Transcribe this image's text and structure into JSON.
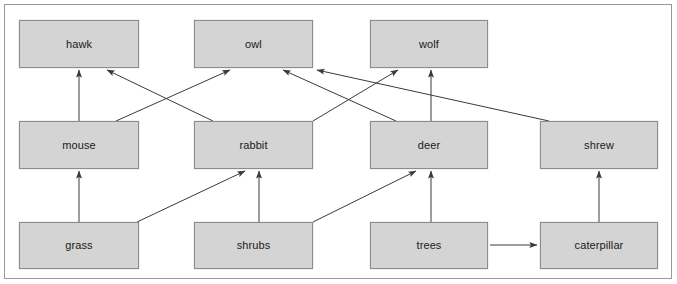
{
  "diagram": {
    "type": "food-web",
    "canvas": {
      "width": 677,
      "height": 284
    },
    "style": {
      "node_fill": "#d4d4d4",
      "node_border": "#8c8c8c",
      "edge_color": "#3a3a3a",
      "frame_border": "#9a9a9a",
      "background": "#ffffff",
      "text_color": "#1a1a1a"
    },
    "nodes": [
      {
        "id": "hawk",
        "label": "hawk",
        "trophic_level": "tertiary consumer",
        "x": 19,
        "y": 20,
        "w": 120,
        "h": 48
      },
      {
        "id": "owl",
        "label": "owl",
        "trophic_level": "tertiary consumer",
        "x": 194,
        "y": 20,
        "w": 119,
        "h": 48
      },
      {
        "id": "wolf",
        "label": "wolf",
        "trophic_level": "tertiary consumer",
        "x": 370,
        "y": 20,
        "w": 118,
        "h": 48
      },
      {
        "id": "mouse",
        "label": "mouse",
        "trophic_level": "primary consumer",
        "x": 19,
        "y": 121,
        "w": 120,
        "h": 48
      },
      {
        "id": "rabbit",
        "label": "rabbit",
        "trophic_level": "primary consumer",
        "x": 194,
        "y": 121,
        "w": 119,
        "h": 48
      },
      {
        "id": "deer",
        "label": "deer",
        "trophic_level": "primary consumer",
        "x": 370,
        "y": 121,
        "w": 118,
        "h": 48
      },
      {
        "id": "shrew",
        "label": "shrew",
        "trophic_level": "secondary consumer",
        "x": 540,
        "y": 121,
        "w": 118,
        "h": 48
      },
      {
        "id": "grass",
        "label": "grass",
        "trophic_level": "producer",
        "x": 19,
        "y": 222,
        "w": 120,
        "h": 47
      },
      {
        "id": "shrubs",
        "label": "shrubs",
        "trophic_level": "producer",
        "x": 194,
        "y": 222,
        "w": 119,
        "h": 47
      },
      {
        "id": "trees",
        "label": "trees",
        "trophic_level": "producer",
        "x": 370,
        "y": 222,
        "w": 118,
        "h": 47
      },
      {
        "id": "caterpillar",
        "label": "caterpillar",
        "trophic_level": "primary consumer",
        "x": 540,
        "y": 222,
        "w": 118,
        "h": 47
      }
    ],
    "edges": [
      {
        "from": "mouse",
        "to": "hawk",
        "x1": 79,
        "y1": 121,
        "x2": 79,
        "y2": 70
      },
      {
        "from": "rabbit",
        "to": "hawk",
        "x1": 213,
        "y1": 121,
        "x2": 107,
        "y2": 70
      },
      {
        "from": "mouse",
        "to": "owl",
        "x1": 116,
        "y1": 121,
        "x2": 230,
        "y2": 70
      },
      {
        "from": "deer",
        "to": "owl",
        "x1": 396,
        "y1": 121,
        "x2": 283,
        "y2": 70
      },
      {
        "from": "shrew",
        "to": "owl",
        "x1": 549,
        "y1": 121,
        "x2": 317,
        "y2": 70
      },
      {
        "from": "rabbit",
        "to": "wolf",
        "x1": 313,
        "y1": 121,
        "x2": 398,
        "y2": 70
      },
      {
        "from": "deer",
        "to": "wolf",
        "x1": 431,
        "y1": 121,
        "x2": 431,
        "y2": 70
      },
      {
        "from": "grass",
        "to": "mouse",
        "x1": 79,
        "y1": 222,
        "x2": 79,
        "y2": 171
      },
      {
        "from": "grass",
        "to": "rabbit",
        "x1": 137,
        "y1": 222,
        "x2": 245,
        "y2": 171
      },
      {
        "from": "shrubs",
        "to": "rabbit",
        "x1": 259,
        "y1": 222,
        "x2": 259,
        "y2": 171
      },
      {
        "from": "shrubs",
        "to": "deer",
        "x1": 313,
        "y1": 222,
        "x2": 416,
        "y2": 171
      },
      {
        "from": "trees",
        "to": "deer",
        "x1": 431,
        "y1": 222,
        "x2": 431,
        "y2": 171
      },
      {
        "from": "trees",
        "to": "caterpillar",
        "x1": 490,
        "y1": 245,
        "x2": 537,
        "y2": 245
      },
      {
        "from": "caterpillar",
        "to": "shrew",
        "x1": 599,
        "y1": 222,
        "x2": 599,
        "y2": 171
      }
    ]
  }
}
